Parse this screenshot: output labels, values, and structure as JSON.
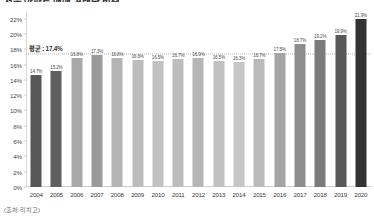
{
  "chart_data": {
    "type": "bar",
    "title": "서울 아파트 매매 거래량 비중",
    "xlabel": "",
    "ylabel": "",
    "ylim": [
      0,
      23
    ],
    "ytick_labels": [
      "0%",
      "2%",
      "4%",
      "6%",
      "8%",
      "10%",
      "12%",
      "14%",
      "16%",
      "18%",
      "20%",
      "22%"
    ],
    "ytick_values": [
      0,
      2,
      4,
      6,
      8,
      10,
      12,
      14,
      16,
      18,
      20,
      22
    ],
    "grid": false,
    "legend": "none",
    "categories": [
      "2004",
      "2005",
      "2006",
      "2007",
      "2008",
      "2009",
      "2010",
      "2011",
      "2012",
      "2013",
      "2014",
      "2015",
      "2016",
      "2017",
      "2018",
      "2019",
      "2020"
    ],
    "values": [
      14.7,
      15.2,
      16.8,
      17.3,
      16.8,
      16.6,
      16.5,
      16.7,
      16.9,
      16.5,
      16.3,
      16.7,
      17.5,
      18.7,
      19.2,
      19.9,
      21.9
    ],
    "value_labels": [
      "14.7%",
      "15.2%",
      "16.8%",
      "17.3%",
      "16.8%",
      "16.6%",
      "16.5%",
      "16.7%",
      "16.9%",
      "16.5%",
      "16.3%",
      "16.7%",
      "17.5%",
      "18.7%",
      "19.2%",
      "19.9%",
      "21.9%"
    ],
    "bar_colors": [
      "#575757",
      "#5f5f5f",
      "#a9a9a9",
      "#9a9a9a",
      "#b4b4b4",
      "#bcbcbc",
      "#c2c2c2",
      "#bdbdbd",
      "#b6b6b6",
      "#c0c0c0",
      "#c6c6c6",
      "#bababa",
      "#a4a4a4",
      "#8d8d8d",
      "#7a7a7a",
      "#595959",
      "#333333"
    ],
    "annotations": [
      {
        "name": "average-line",
        "label": "평균 : 17.4%",
        "value": 17.4,
        "style": "dotted-horizontal"
      }
    ],
    "source": "(출처: 리치고)"
  },
  "axis": {
    "y_max_label": "22%",
    "y_min_label": "0%"
  },
  "colors": {
    "axis": "#d8d8d8",
    "baseline": "#cfcfcf",
    "average_line": "#b9b9b9",
    "text": "#3c3c3c",
    "background": "#ffffff"
  }
}
